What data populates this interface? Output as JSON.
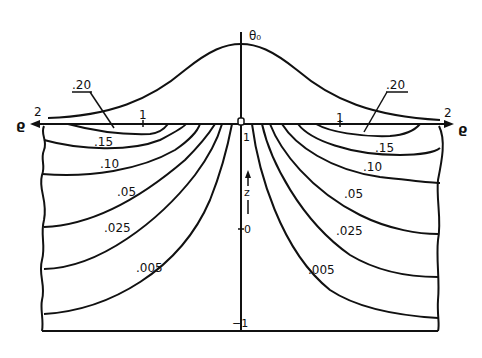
{
  "diagram": {
    "title_symbol": "θ₀",
    "axes": {
      "horizontal_label_left": "ϱ",
      "horizontal_label_right": "ϱ",
      "vertical_label": "z",
      "ticks": {
        "left_2": "2",
        "left_1": "1",
        "origin": "0",
        "right_1": "1",
        "right_2": "2",
        "z_1": "1",
        "z_0": "0",
        "z_m1": "−1"
      }
    },
    "contour_labels": {
      "c020_left": ".20",
      "c020_right": ".20",
      "c015_left": ".15",
      "c015_right": ".15",
      "c010_left": ".10",
      "c010_right": ".10",
      "c005_left": ".05",
      "c005_right": ".05",
      "c0025_left": ".025",
      "c0025_right": ".025",
      "c0005_left": ".005",
      "c0005_right": ".005"
    },
    "contour_values": [
      0.2,
      0.15,
      0.1,
      0.05,
      0.025,
      0.005
    ]
  }
}
